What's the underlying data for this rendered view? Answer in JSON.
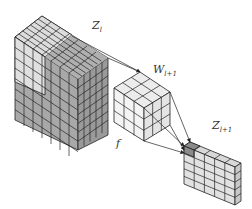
{
  "diagram": {
    "type": "convolution-layer-illustration",
    "labels": {
      "input_layer": "Z",
      "input_layer_sub": "l",
      "kernel": "W",
      "kernel_sub": "l+1",
      "output_layer": "Z",
      "output_layer_sub": "l+1",
      "activation": "f"
    },
    "blocks": [
      {
        "name": "input-feature-volume",
        "grid": [
          7,
          5,
          7
        ],
        "note": "lighter receptive-field region top-left, darker remainder"
      },
      {
        "name": "kernel-cube",
        "grid": [
          3,
          3,
          3
        ]
      },
      {
        "name": "output-feature-map",
        "grid": [
          5,
          1,
          6
        ],
        "note": "top-left cell highlighted dark"
      }
    ],
    "colors": {
      "light_cell": "#e6e6e6",
      "mid_cell": "#bdbdbd",
      "dark_cell": "#9a9a9a",
      "highlight_cell": "#8a8a8a",
      "line": "#222222",
      "background": "#ffffff"
    }
  }
}
